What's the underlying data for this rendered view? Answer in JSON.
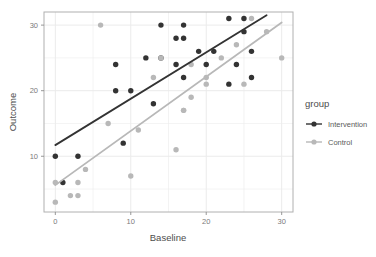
{
  "chart_data": {
    "type": "scatter",
    "title": "",
    "xlabel": "Baseline",
    "ylabel": "Outcome",
    "xlim": [
      -1.5,
      31.5
    ],
    "ylim": [
      1.5,
      32.0
    ],
    "xticks": [
      0,
      10,
      20,
      30
    ],
    "xtick_labels": [
      "0",
      "10",
      "20",
      "30"
    ],
    "yticks": [
      10,
      20,
      30
    ],
    "ytick_labels": [
      "10",
      "20",
      "30"
    ],
    "grid": true,
    "legend_position": "right",
    "legend_title": "group",
    "series": [
      {
        "name": "Intervention",
        "color": "#333333",
        "points": [
          [
            0,
            10
          ],
          [
            1,
            6
          ],
          [
            3,
            10
          ],
          [
            8,
            24
          ],
          [
            8,
            20
          ],
          [
            9,
            12
          ],
          [
            10,
            20
          ],
          [
            12,
            25
          ],
          [
            13,
            18
          ],
          [
            14,
            30
          ],
          [
            14,
            25
          ],
          [
            16,
            24
          ],
          [
            16,
            28
          ],
          [
            17,
            30
          ],
          [
            17,
            28
          ],
          [
            17,
            22
          ],
          [
            19,
            26
          ],
          [
            20,
            24
          ],
          [
            21,
            26
          ],
          [
            23,
            31
          ],
          [
            23,
            21
          ],
          [
            24,
            24
          ],
          [
            25,
            29
          ],
          [
            25,
            31
          ],
          [
            26,
            22
          ],
          [
            26,
            26
          ]
        ],
        "fit_line": {
          "x0": 0,
          "y0": 11.7,
          "x1": 28,
          "y1": 31.5
        }
      },
      {
        "name": "Control",
        "color": "#b8b8b8",
        "points": [
          [
            0,
            6
          ],
          [
            0,
            3
          ],
          [
            2,
            4
          ],
          [
            3,
            4
          ],
          [
            3,
            6
          ],
          [
            4,
            8
          ],
          [
            6,
            30
          ],
          [
            7,
            15
          ],
          [
            10,
            7
          ],
          [
            11,
            14
          ],
          [
            13,
            22
          ],
          [
            14,
            25
          ],
          [
            16,
            11
          ],
          [
            17,
            17
          ],
          [
            17,
            17
          ],
          [
            18,
            19
          ],
          [
            18,
            24
          ],
          [
            20,
            22
          ],
          [
            20,
            21
          ],
          [
            22,
            25
          ],
          [
            24,
            27
          ],
          [
            25,
            21
          ],
          [
            26,
            31
          ],
          [
            28,
            29
          ],
          [
            30,
            25
          ]
        ],
        "fit_line": {
          "x0": 0,
          "y0": 5.6,
          "x1": 30,
          "y1": 30.4
        }
      }
    ]
  },
  "legend": {
    "title": "group",
    "items": [
      {
        "label": "Intervention",
        "color": "#333333"
      },
      {
        "label": "Control",
        "color": "#b8b8b8"
      }
    ]
  },
  "axes": {
    "x_title": "Baseline",
    "y_title": "Outcome",
    "x_tick_labels": [
      "0",
      "10",
      "20",
      "30"
    ],
    "y_tick_labels": [
      "10",
      "20",
      "30"
    ]
  },
  "colors": {
    "panel_background": "#ffffff",
    "grid": "#ebebeb",
    "panel_border": "#b0b0b0",
    "text": "#4d4d4d",
    "tick_text": "#7a7a7a",
    "intervention": "#333333",
    "control": "#b8b8b8"
  }
}
